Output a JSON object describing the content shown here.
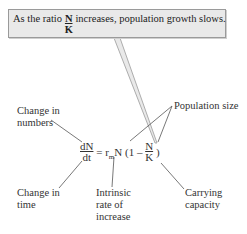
{
  "callout": {
    "text_before": "As the ratio",
    "ratio_num": "N",
    "ratio_den": "K",
    "text_after": "increases, population growth slows."
  },
  "equation": {
    "lhs_num": "dN",
    "lhs_den": "dt",
    "equals": "=",
    "r": "r",
    "r_sub": "m",
    "N": "N",
    "paren_open": "(1 –",
    "frac_num": "N",
    "frac_den": "K",
    "paren_close": ")"
  },
  "labels": {
    "change_numbers_1": "Change in",
    "change_numbers_2": "numbers",
    "population_size": "Population size",
    "change_time_1": "Change in",
    "change_time_2": "time",
    "intrinsic_1": "Intrinsic",
    "intrinsic_2": "rate of",
    "intrinsic_3": "increase",
    "carrying_1": "Carrying",
    "carrying_2": "capacity"
  }
}
